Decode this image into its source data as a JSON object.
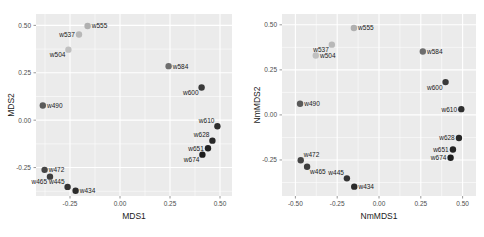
{
  "chart_data": [
    {
      "id": "mds",
      "type": "scatter",
      "title": "",
      "xlabel": "MDS1",
      "ylabel": "MDS2",
      "xlim": [
        -0.42,
        0.56
      ],
      "ylim": [
        -0.4,
        0.56
      ],
      "xticks": [
        -0.25,
        0.0,
        0.25,
        0.5
      ],
      "xticklabels": [
        "-0.25",
        "0.00",
        "0.25",
        "0.50"
      ],
      "yticks": [
        -0.25,
        0.0,
        0.25,
        0.5
      ],
      "yticklabels": [
        "-0.25",
        "0.00",
        "0.25",
        "0.50"
      ],
      "grid": true,
      "legend": "none",
      "panel_background": "#ebebeb",
      "grid_color": "#ffffff",
      "points": [
        {
          "label": "w555",
          "x": -0.162,
          "y": 0.497,
          "color": "#b0b0b0",
          "label_pos": "right"
        },
        {
          "label": "w537",
          "x": -0.205,
          "y": 0.452,
          "color": "#b8b8b8",
          "label_pos": "left"
        },
        {
          "label": "w504",
          "x": -0.258,
          "y": 0.372,
          "color": "#c0c0c0",
          "label_pos": "below-left"
        },
        {
          "label": "w584",
          "x": 0.243,
          "y": 0.285,
          "color": "#6e6e6e",
          "label_pos": "right"
        },
        {
          "label": "w600",
          "x": 0.408,
          "y": 0.172,
          "color": "#3a3a3a",
          "label_pos": "below-left"
        },
        {
          "label": "w490",
          "x": -0.386,
          "y": 0.077,
          "color": "#5a5a5a",
          "label_pos": "right"
        },
        {
          "label": "w610",
          "x": 0.487,
          "y": -0.032,
          "color": "#2e2e2e",
          "label_pos": "above-left"
        },
        {
          "label": "w628",
          "x": 0.462,
          "y": -0.108,
          "color": "#272727",
          "label_pos": "above-left"
        },
        {
          "label": "w651",
          "x": 0.44,
          "y": -0.148,
          "color": "#222222",
          "label_pos": "left"
        },
        {
          "label": "w674",
          "x": 0.412,
          "y": -0.182,
          "color": "#1c1c1c",
          "label_pos": "below-left"
        },
        {
          "label": "w472",
          "x": -0.377,
          "y": -0.262,
          "color": "#454545",
          "label_pos": "right"
        },
        {
          "label": "w465",
          "x": -0.35,
          "y": -0.298,
          "color": "#3e3e3e",
          "label_pos": "below-left"
        },
        {
          "label": "w445",
          "x": -0.262,
          "y": -0.352,
          "color": "#343434",
          "label_pos": "above-left"
        },
        {
          "label": "w434",
          "x": -0.222,
          "y": -0.372,
          "color": "#2b2b2b",
          "label_pos": "right"
        }
      ]
    },
    {
      "id": "nmmds",
      "type": "scatter",
      "title": "",
      "xlabel": "NmMDS1",
      "ylabel": "NmMDS2",
      "xlim": [
        -0.58,
        0.58
      ],
      "ylim": [
        -0.45,
        0.56
      ],
      "xticks": [
        -0.5,
        -0.25,
        0.0,
        0.25,
        0.5
      ],
      "xticklabels": [
        "-0.50",
        "-0.25",
        "0.00",
        "0.25",
        "0.50"
      ],
      "yticks": [
        -0.25,
        0.0,
        0.25,
        0.5
      ],
      "yticklabels": [
        "-0.25",
        "0.00",
        "0.25",
        "0.50"
      ],
      "grid": true,
      "legend": "none",
      "panel_background": "#ebebeb",
      "grid_color": "#ffffff",
      "points": [
        {
          "label": "w555",
          "x": -0.15,
          "y": 0.482,
          "color": "#b0b0b0",
          "label_pos": "right"
        },
        {
          "label": "w537",
          "x": -0.282,
          "y": 0.39,
          "color": "#b8b8b8",
          "label_pos": "below-left"
        },
        {
          "label": "w504",
          "x": -0.378,
          "y": 0.33,
          "color": "#c0c0c0",
          "label_pos": "right"
        },
        {
          "label": "w584",
          "x": 0.262,
          "y": 0.352,
          "color": "#6e6e6e",
          "label_pos": "right"
        },
        {
          "label": "w600",
          "x": 0.398,
          "y": 0.182,
          "color": "#3a3a3a",
          "label_pos": "below-left"
        },
        {
          "label": "w490",
          "x": -0.472,
          "y": 0.062,
          "color": "#5a5a5a",
          "label_pos": "right"
        },
        {
          "label": "w610",
          "x": 0.492,
          "y": 0.032,
          "color": "#2e2e2e",
          "label_pos": "left"
        },
        {
          "label": "w628",
          "x": 0.478,
          "y": -0.128,
          "color": "#272727",
          "label_pos": "left"
        },
        {
          "label": "w651",
          "x": 0.442,
          "y": -0.192,
          "color": "#222222",
          "label_pos": "left"
        },
        {
          "label": "w674",
          "x": 0.428,
          "y": -0.238,
          "color": "#1c1c1c",
          "label_pos": "left"
        },
        {
          "label": "w472",
          "x": -0.468,
          "y": -0.252,
          "color": "#454545",
          "label_pos": "above-right"
        },
        {
          "label": "w465",
          "x": -0.43,
          "y": -0.288,
          "color": "#3e3e3e",
          "label_pos": "below-right"
        },
        {
          "label": "w445",
          "x": -0.192,
          "y": -0.352,
          "color": "#343434",
          "label_pos": "above-left"
        },
        {
          "label": "w434",
          "x": -0.148,
          "y": -0.398,
          "color": "#2b2b2b",
          "label_pos": "right"
        }
      ]
    }
  ]
}
